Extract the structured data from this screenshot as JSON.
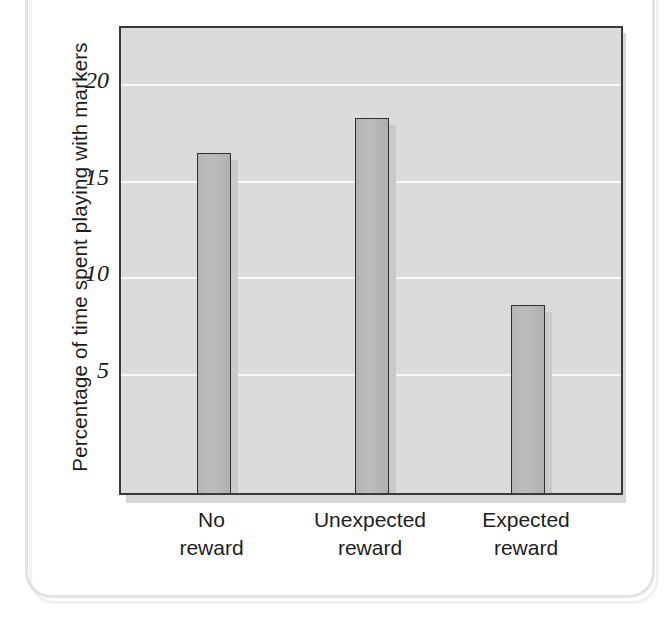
{
  "chart_data": {
    "type": "bar",
    "title": "",
    "subtitle": "",
    "xlabel": "",
    "ylabel": "Percentage of time spent playing with markers",
    "categories": [
      "No\nreward",
      "Unexpected\nreward",
      "Expected\nreward"
    ],
    "category_lines": [
      [
        "No",
        "reward"
      ],
      [
        "Unexpected",
        "reward"
      ],
      [
        "Expected",
        "reward"
      ]
    ],
    "values": [
      16.5,
      18.3,
      8.6
    ],
    "ylim": [
      0,
      22.5
    ],
    "yticks": [
      5,
      10,
      15,
      20
    ],
    "ytick_labels": [
      "5",
      "10",
      "15",
      "20"
    ],
    "grid": true,
    "gridlines_visible": [
      5,
      10,
      15,
      20
    ],
    "legend": null,
    "legend_position": "none",
    "colors": {
      "bar_fill": "#b7b7b7",
      "bar_border": "#2e2e2e",
      "plot_background": "#dbdbdb",
      "grid_color": "#f7f7f7",
      "axis_color": "#3a3a3a",
      "text_color": "#1d1d1d",
      "page_border": "#e2e2e2"
    }
  },
  "page": {
    "bleed_through_lines": [
      "the problem that",
      "",
      "in 1973, Mark",
      "number of chil-",
      "experimental in-",
      "each drew",
      "were told that",
      "draw with the",
      "were simply",
      "also allowed",
      "reward, as children",
      "with markers."
    ]
  }
}
